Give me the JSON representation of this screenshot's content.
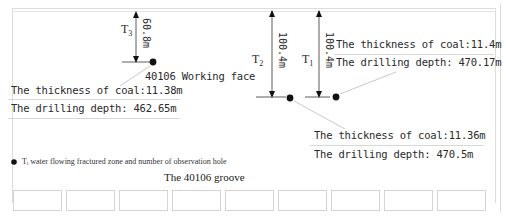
{
  "diagram": {
    "title": "The 40106 groove",
    "working_face_label": "40106 Working face",
    "legend": {
      "symbol": "●",
      "text": "Tᵢ water flowing fractured zone and number of observation hole"
    },
    "holes": [
      {
        "id": "T3",
        "label_main": "T",
        "label_sub": "3",
        "height_label": "60.8m",
        "coal_thickness": "The thickness of coal:11.38m",
        "drilling_depth": "The drilling depth: 462.65m"
      },
      {
        "id": "T2",
        "label_main": "T",
        "label_sub": "2",
        "height_label": "100.4m",
        "coal_thickness": "The thickness of coal:11.36m",
        "drilling_depth": "The drilling depth: 470.5m"
      },
      {
        "id": "T1",
        "label_main": "T",
        "label_sub": "1",
        "height_label": "100.4m",
        "coal_thickness": "The thickness of coal:11.4m",
        "drilling_depth": "The drilling depth: 470.17m"
      }
    ],
    "bottom_box_count": 9,
    "colors": {
      "line": "#222222",
      "leader": "#bbbbbb",
      "frame": "#dcdcdc"
    }
  }
}
